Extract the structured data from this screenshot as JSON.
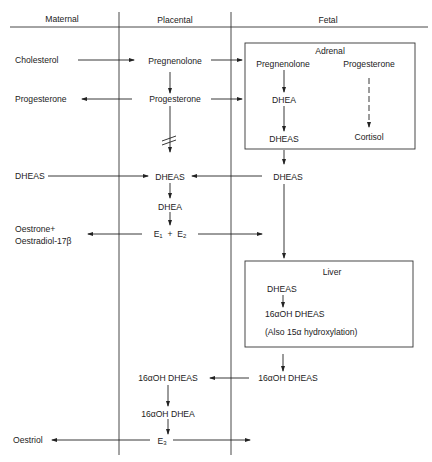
{
  "columns": {
    "maternal": "Maternal",
    "placental": "Placental",
    "fetal": "Fetal"
  },
  "boxes": {
    "adrenal": {
      "title": "Adrenal",
      "pregnenolone": "Pregnenolone",
      "progesterone": "Progesterone",
      "dhea": "DHEA",
      "dheas": "DHEAS",
      "cortisol": "Cortisol"
    },
    "liver": {
      "title": "Liver",
      "dheas": "DHEAS",
      "oh_dheas": "16αOH DHEAS",
      "note": "(Also 15α hydroxylation)"
    }
  },
  "maternal": {
    "cholesterol": "Cholesterol",
    "progesterone": "Progesterone",
    "dheas": "DHEAS",
    "oestrone": "Oestrone+",
    "oestradiol": "Oestradiol-17β",
    "oestriol": "Oestriol"
  },
  "placental": {
    "pregnenolone": "Pregnenolone",
    "progesterone": "Progesterone",
    "dheas": "DHEAS",
    "dhea": "DHEA",
    "e1": "E",
    "e1_sub": "1",
    "plus": "+",
    "e2": "E",
    "e2_sub": "2",
    "oh_dheas": "16αOH DHEAS",
    "oh_dhea": "16αOH DHEA",
    "e3": "E",
    "e3_sub": "3"
  },
  "fetal": {
    "dheas": "DHEAS",
    "oh_dheas": "16αOH DHEAS"
  }
}
